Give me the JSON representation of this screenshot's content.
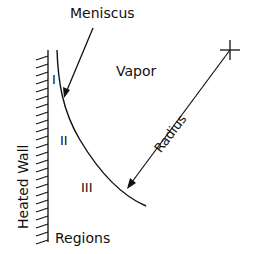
{
  "diagram": {
    "labels": {
      "meniscus": "Meniscus",
      "vapor": "Vapor",
      "radius": "Radius",
      "region_1": "I",
      "region_2": "II",
      "region_3": "III",
      "heated_wall": "Heated Wall",
      "regions": "Regions"
    },
    "colors": {
      "stroke": "#111111",
      "background": "#ffffff"
    }
  }
}
